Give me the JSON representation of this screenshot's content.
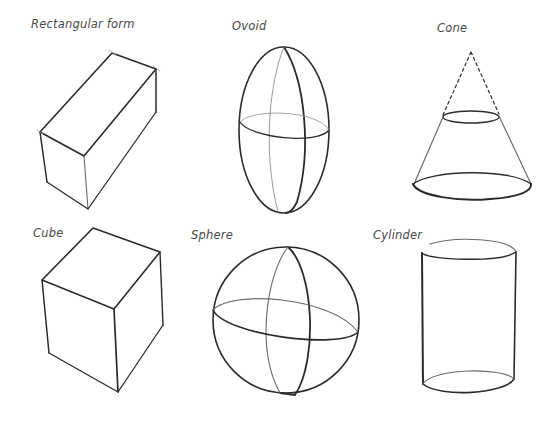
{
  "figure": {
    "shapes": [
      {
        "id": "rectangular-form",
        "label": "Rectangular form"
      },
      {
        "id": "ovoid",
        "label": "Ovoid"
      },
      {
        "id": "cone",
        "label": "Cone"
      },
      {
        "id": "cube",
        "label": "Cube"
      },
      {
        "id": "sphere",
        "label": "Sphere"
      },
      {
        "id": "cylinder",
        "label": "Cylinder"
      }
    ],
    "stroke_color": "#2b2b2b",
    "label_color": "#4a4a4a",
    "background": "#ffffff"
  }
}
